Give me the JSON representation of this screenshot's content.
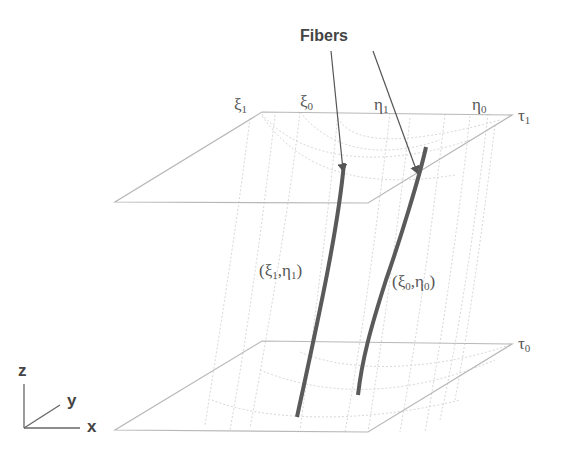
{
  "title_label": "Fibers",
  "axes": {
    "z": "z",
    "y": "y",
    "x": "x"
  },
  "top_plane": {
    "label": "τ",
    "label_sub": "1",
    "ticks": [
      {
        "sym": "ξ",
        "sub": "1"
      },
      {
        "sym": "ξ",
        "sub": "0"
      },
      {
        "sym": "η",
        "sub": "1"
      },
      {
        "sym": "η",
        "sub": "0"
      }
    ]
  },
  "bottom_plane": {
    "label": "τ",
    "label_sub": "0"
  },
  "fibers": [
    {
      "label_open": "(ξ",
      "sub1": "1",
      "mid": ",η",
      "sub2": "1",
      "close": ")"
    },
    {
      "label_open": "(ξ",
      "sub1": "0",
      "mid": ",η",
      "sub2": "0",
      "close": ")"
    }
  ],
  "colors": {
    "plane": "#b5b5b5",
    "grid": "#d6d6d6",
    "fiber": "#5a5a5a",
    "arrow": "#555555",
    "text": "#555555"
  }
}
